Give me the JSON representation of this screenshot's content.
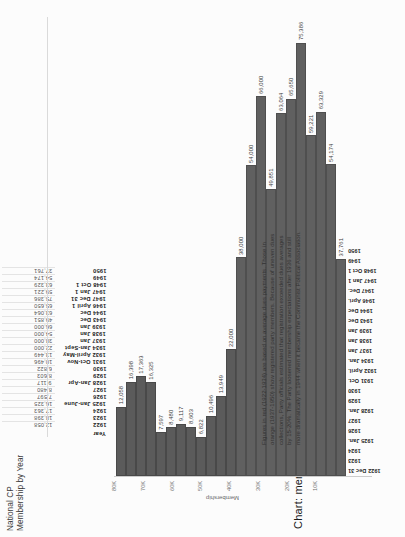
{
  "table": {
    "title": "National CP Membership by Year",
    "header_label": "Year",
    "columns": [
      {
        "year": "1922",
        "value": "12,058"
      },
      {
        "year": "1923",
        "value": "18,398"
      },
      {
        "year": "1924",
        "value": "17,363"
      },
      {
        "year": "1925 Jan-June",
        "value": "16,325"
      },
      {
        "year": "1926",
        "value": "7,597"
      },
      {
        "year": "1927",
        "value": "8,480"
      },
      {
        "year": "1928 Jan-Apr",
        "value": "9,117"
      },
      {
        "year": "1929",
        "value": "8,603"
      },
      {
        "year": "1930",
        "value": "6,822"
      },
      {
        "year": "1931 Oct-Nov",
        "value": "10,496"
      },
      {
        "year": "1932 April-May",
        "value": "13,449"
      },
      {
        "year": "1934 Jan-Sept",
        "value": "22,000"
      },
      {
        "year": "1937 Jan",
        "value": "38,000"
      },
      {
        "year": "1938 Jan",
        "value": "54,000"
      },
      {
        "year": "1939 Jan",
        "value": "66,000"
      },
      {
        "year": "1943 Dec",
        "value": "49,851"
      },
      {
        "year": "1944 Dec",
        "value": "63,064"
      },
      {
        "year": "1946 April 1",
        "value": "65,650"
      },
      {
        "year": "1947 Dec 31",
        "value": "75,386"
      },
      {
        "year": "1947 Jan 1",
        "value": "59,221"
      },
      {
        "year": "1948 Oct 1",
        "value": "63,329"
      },
      {
        "year": "1949",
        "value": "54,174"
      },
      {
        "year": "1950",
        "value": "37,761"
      }
    ]
  },
  "chart": {
    "title": "Chart: membership by year",
    "note": "Figures in red (1922-1934) are based on average dues payments. Those in orange (1937-1950) show registered party members. Because of uneven dues collections, Party officials estimated that registration exceeded dues averages by 15-20%. The Party loosened membership expectations after 1936 and still more dramatically in 1944 when it became the Communist Political Association."
  },
  "chart_data": {
    "type": "bar",
    "title": "Chart: membership by year",
    "xlabel": "Year",
    "ylabel": "Membership",
    "orientation": "vertical",
    "grid": false,
    "legend": "none",
    "ylim": [
      0,
      80000
    ],
    "ytick_labels": [
      "80K",
      "70K",
      "60K",
      "50K",
      "40K",
      "30K",
      "20K",
      "10K"
    ],
    "ytick_values": [
      80000,
      70000,
      60000,
      50000,
      40000,
      30000,
      20000,
      10000
    ],
    "categories": [
      "1922 Dec 31",
      "1923",
      "1924",
      "1925 Jan.",
      "1926",
      "1927",
      "1928 Jan.",
      "1929",
      "1930",
      "1931 Oct.",
      "1932 April.",
      "1934 Jan.",
      "1937 Jan",
      "1938 Jan",
      "1939 Jan",
      "1943 Dec",
      "1944 Dec",
      "1946 Apri.",
      "1947 Dec.",
      "1947 Jan 1",
      "1948 Oct 1",
      "1949",
      "1950"
    ],
    "values": [
      12058,
      16398,
      17363,
      16325,
      7597,
      8480,
      9117,
      8603,
      6822,
      10496,
      13949,
      22000,
      38000,
      54000,
      66000,
      49851,
      63064,
      65650,
      75386,
      59221,
      63329,
      54174,
      37761
    ],
    "data_labels": [
      "12,058",
      "16,398",
      "17,363",
      "16,325",
      "7,597",
      "8,480",
      "9,117",
      "8,603",
      "6,822",
      "10,496",
      "13,949",
      "22,000",
      "38,000",
      "54,000",
      "66,000",
      "49,851",
      "63,064",
      "65,650",
      "75,386",
      "59,221",
      "63,329",
      "54,174",
      "37,761"
    ],
    "series_groups": [
      {
        "name": "dues-average (1922-1934)",
        "color": "#5b5b5b",
        "indices": [
          0,
          1,
          2,
          3,
          4,
          5,
          6,
          7,
          8,
          9,
          10,
          11
        ]
      },
      {
        "name": "registered members (1937-1950)",
        "color": "#606060",
        "indices": [
          12,
          13,
          14,
          15,
          16,
          17,
          18,
          19,
          20,
          21,
          22
        ]
      }
    ],
    "annotation": "Figures in red (1922-1934) are based on average dues payments. Those in orange (1937-1950) show registered party members. Because of uneven dues collections, Party officials estimated that registration exceeded dues averages by 15-20%. The Party loosened membership expectations after 1936 and still more dramatically in 1944 when it became the Communist Political Association."
  },
  "colors": {
    "bar": "#606060",
    "bar_early": "#5b5b5b",
    "axis": "#cccccc",
    "text": "#2b2b2b"
  }
}
